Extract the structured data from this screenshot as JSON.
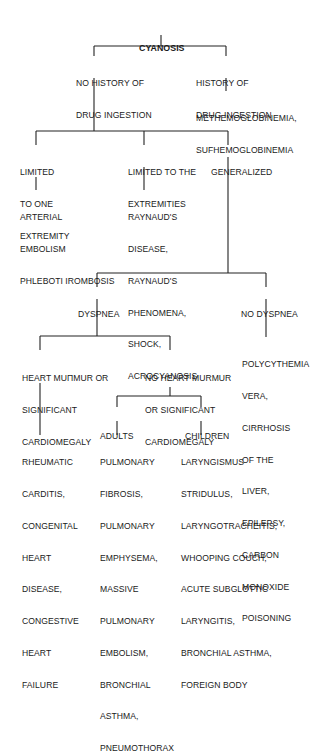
{
  "diagram": {
    "type": "flowchart",
    "title": "CYANOSIS",
    "nodes": {
      "root": {
        "lines": [
          "CYANOSIS"
        ]
      },
      "no_history": {
        "lines": [
          "NO HISTORY OF",
          "DRUG INGESTION"
        ]
      },
      "history": {
        "lines": [
          "HISTORY OF",
          "DRUG INGESTION"
        ]
      },
      "methemo": {
        "lines": [
          "METHEMOGLOBINEMIA,",
          "SUFHEMOGLOBINEMIA"
        ]
      },
      "limited_one": {
        "lines": [
          "LIMITED",
          "TO ONE",
          "EXTREMITY"
        ]
      },
      "limited_ext": {
        "lines": [
          "LIMITED TO THE",
          "EXTREMITIES"
        ]
      },
      "generalized": {
        "lines": [
          "GENERALIZED"
        ]
      },
      "arterial": {
        "lines": [
          "ARTERIAL",
          "EMBOLISM",
          "PHLEBOTI IROMBOSIS"
        ]
      },
      "raynaud": {
        "lines": [
          "RAYNAUD'S",
          "DISEASE,",
          "RAYNAUD'S",
          "PHENOMENA,",
          "SHOCK,",
          "ACROCYANOSIS"
        ]
      },
      "dyspnea": {
        "lines": [
          "DYSPNEA"
        ]
      },
      "no_dyspnea": {
        "lines": [
          "NO DYSPNEA"
        ]
      },
      "polycythemia": {
        "lines": [
          "POLYCYTHEMIA",
          "VERA,",
          "CIRRHOSIS",
          "OF THE",
          "LIVER,",
          "EPILEPSY,",
          "CARBON",
          "MONOXIDE",
          "POISONING"
        ]
      },
      "heart_murmur": {
        "lines": [
          "HEART MUΠMUR OR",
          "SIGNIFICANT",
          "CARDIOMEGALY"
        ]
      },
      "no_heart_murmur": {
        "lines": [
          "NO HEART MURMUR",
          "OR SIGNIFICANT",
          "CARDIOMEGALY"
        ]
      },
      "adults": {
        "lines": [
          "ADULTS"
        ]
      },
      "children": {
        "lines": [
          "CHILDREN"
        ]
      },
      "rheumatic": {
        "lines": [
          "RHEUMATIC",
          "CARDITIS,",
          "CONGENITAL",
          "HEART",
          "DISEASE,",
          "CONGESTIVE",
          "HEART",
          "FAILURE"
        ]
      },
      "pulmonary": {
        "lines": [
          "PULMONARY",
          "FIBROSIS,",
          "PULMONARY",
          "EMPHYSEMA,",
          "MASSIVE",
          "PULMONARY",
          "EMBOLISM,",
          "BRONCHIAL",
          "ASTHMA,",
          "PNEUMOTHORAX"
        ]
      },
      "laryngismus": {
        "lines": [
          "LARYNGISMUS",
          "STRIDULUS,",
          "LARYNGOTRACHEITIS,",
          "WHOOPING COUCH,",
          "ACUTE SUBGLOTTIC",
          "LARYNGITIS,",
          "BRONCHIAL ASTHMA,",
          "FOREIGN BODY"
        ]
      }
    },
    "edges": [
      [
        "root",
        "no_history"
      ],
      [
        "root",
        "history"
      ],
      [
        "history",
        "methemo"
      ],
      [
        "no_history",
        "limited_one"
      ],
      [
        "no_history",
        "limited_ext"
      ],
      [
        "no_history",
        "generalized"
      ],
      [
        "limited_one",
        "arterial"
      ],
      [
        "limited_ext",
        "raynaud"
      ],
      [
        "generalized",
        "dyspnea"
      ],
      [
        "generalized",
        "no_dyspnea"
      ],
      [
        "no_dyspnea",
        "polycythemia"
      ],
      [
        "dyspnea",
        "heart_murmur"
      ],
      [
        "dyspnea",
        "no_heart_murmur"
      ],
      [
        "heart_murmur",
        "rheumatic"
      ],
      [
        "no_heart_murmur",
        "adults"
      ],
      [
        "no_heart_murmur",
        "children"
      ],
      [
        "adults",
        "pulmonary"
      ],
      [
        "children",
        "laryngismus"
      ]
    ],
    "colors": {
      "text": "#1a1a1a",
      "lines": "#222222",
      "background": "#ffffff"
    }
  }
}
